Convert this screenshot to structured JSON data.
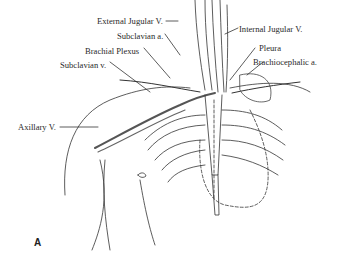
{
  "figure": {
    "panel_letter": "A",
    "labels": {
      "external_jugular_v": "External Jugular V.",
      "subclavian_a": "Subclavian a.",
      "brachial_plexus": "Brachial Plexus",
      "subclavian_v": "Subclavian v.",
      "axillary_v": "Axillary V.",
      "internal_jugular_v": "Internal Jugular V.",
      "pleura": "Pleura",
      "brachiocephalic_a": "Brachiocephalic a."
    }
  }
}
